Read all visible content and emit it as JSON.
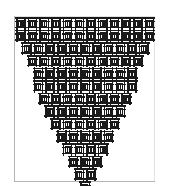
{
  "figure": {
    "title": "Recursive weave triangle pattern"
  },
  "colors": {
    "background": "#ffffff",
    "ink": "#1a1a1a",
    "frame_dark": "#b4b4b4",
    "frame_light": "#e2e2e2"
  },
  "frame": {
    "left": 14,
    "top": 16,
    "width": 141,
    "height": 166
  },
  "pattern": {
    "type": "stepped-triangle",
    "orientation": "inverted",
    "rows": 13,
    "top_row_count": 12,
    "bottom_row_count": 1,
    "decrement_per_row": 1,
    "cell_width": 11.7,
    "cell_height": 12.6,
    "origin_x": 15,
    "origin_y": 17,
    "row_counts": [
      12,
      12,
      11,
      10,
      9,
      9,
      8,
      7,
      6,
      5,
      4,
      3,
      2,
      1
    ],
    "row_offsets": [
      0,
      0,
      0.5,
      1,
      1.5,
      1.5,
      2,
      2.5,
      3,
      3.5,
      4,
      4.5,
      5,
      5.5
    ],
    "stroke_width": 1.5,
    "motif_name": "interlocking-rectangle-weave"
  },
  "motif": {
    "name": "weave-cell",
    "parts": [
      "outer-vertical-bar-left",
      "outer-vertical-bar-right",
      "top-horizontal-cap",
      "bottom-horizontal-cap",
      "inner-rectangle"
    ],
    "inner_rect_inset_x": 0.3,
    "inner_rect_inset_y": 0.28
  }
}
